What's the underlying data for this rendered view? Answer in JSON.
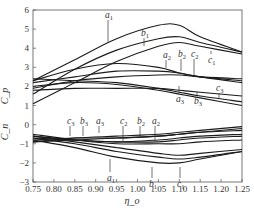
{
  "chart_data": {
    "type": "line",
    "title": "",
    "xlabel": "η_o",
    "ylabel_upper": "C_p",
    "ylabel_lower": "C_n",
    "xlim": [
      0.75,
      1.25
    ],
    "ylim": [
      -3,
      6
    ],
    "xticks": [
      "0.75",
      "0.80",
      "0.85",
      "0.90",
      "0.95",
      "1.00",
      "1.05",
      "1.10",
      "1.15",
      "1.20",
      "1.25"
    ],
    "yticks": [
      "6",
      "5",
      "4",
      "3",
      "2",
      "1",
      "0",
      "-1",
      "-2",
      "-3"
    ],
    "grid": false,
    "legend": "inline labels",
    "x": [
      0.75,
      0.85,
      0.95,
      1.05,
      1.1,
      1.15,
      1.25
    ],
    "series": [
      {
        "name": "a1",
        "group": "C_p",
        "values": [
          2.3,
          3.4,
          4.5,
          5.2,
          5.2,
          4.6,
          3.8
        ]
      },
      {
        "name": "b1",
        "group": "C_p",
        "values": [
          1.6,
          2.9,
          3.9,
          4.5,
          4.6,
          4.3,
          3.8
        ]
      },
      {
        "name": "c1",
        "group": "C_p",
        "values": [
          1.1,
          2.2,
          3.3,
          4.1,
          4.3,
          4.1,
          3.7
        ]
      },
      {
        "name": "a2",
        "group": "C_p",
        "values": [
          2.3,
          2.9,
          3.2,
          3.0,
          2.7,
          2.5,
          2.2
        ]
      },
      {
        "name": "b2",
        "group": "C_p",
        "values": [
          2.2,
          2.5,
          2.8,
          2.8,
          2.7,
          2.5,
          2.3
        ]
      },
      {
        "name": "c2",
        "group": "C_p",
        "values": [
          1.9,
          2.3,
          2.5,
          2.6,
          2.6,
          2.5,
          2.4
        ]
      },
      {
        "name": "a3",
        "group": "C_p",
        "values": [
          2.4,
          2.3,
          2.2,
          1.9,
          1.7,
          1.5,
          1.2
        ]
      },
      {
        "name": "b3",
        "group": "C_p",
        "values": [
          2.0,
          2.2,
          2.1,
          1.8,
          1.6,
          1.4,
          1.0
        ]
      },
      {
        "name": "c3",
        "group": "C_p",
        "values": [
          1.8,
          1.9,
          1.9,
          1.9,
          1.8,
          1.7,
          1.5
        ]
      },
      {
        "name": "a1",
        "group": "C_n",
        "values": [
          -0.8,
          -1.2,
          -1.7,
          -2.0,
          -2.0,
          -1.8,
          -1.4
        ]
      },
      {
        "name": "b1",
        "group": "C_n",
        "values": [
          -0.7,
          -1.0,
          -1.4,
          -1.7,
          -1.8,
          -1.7,
          -1.4
        ]
      },
      {
        "name": "c1",
        "group": "C_n",
        "values": [
          -0.6,
          -0.9,
          -1.2,
          -1.5,
          -1.6,
          -1.5,
          -1.3
        ]
      },
      {
        "name": "a2",
        "group": "C_n",
        "values": [
          -0.5,
          -0.8,
          -1.0,
          -1.0,
          -1.0,
          -0.9,
          -0.8
        ]
      },
      {
        "name": "b2",
        "group": "C_n",
        "values": [
          -0.6,
          -0.8,
          -0.9,
          -0.9,
          -0.8,
          -0.7,
          -0.6
        ]
      },
      {
        "name": "c2",
        "group": "C_n",
        "values": [
          -0.7,
          -0.8,
          -0.9,
          -0.8,
          -0.7,
          -0.6,
          -0.5
        ]
      },
      {
        "name": "a3",
        "group": "C_n",
        "values": [
          -0.8,
          -0.7,
          -0.7,
          -0.6,
          -0.5,
          -0.4,
          -0.3
        ]
      },
      {
        "name": "b3",
        "group": "C_n",
        "values": [
          -0.9,
          -0.8,
          -0.7,
          -0.6,
          -0.5,
          -0.4,
          -0.2
        ]
      },
      {
        "name": "c3",
        "group": "C_n",
        "values": [
          -0.9,
          -0.7,
          -0.6,
          -0.5,
          -0.4,
          -0.3,
          -0.1
        ]
      }
    ]
  },
  "labels": {
    "cp": [
      "a1",
      "b1",
      "a2",
      "b2",
      "c2",
      "c1",
      "c3",
      "a3",
      "b3"
    ],
    "cn": [
      "c3",
      "b3",
      "a3",
      "c2",
      "b2",
      "a2",
      "a1",
      "b1",
      "c1"
    ]
  }
}
